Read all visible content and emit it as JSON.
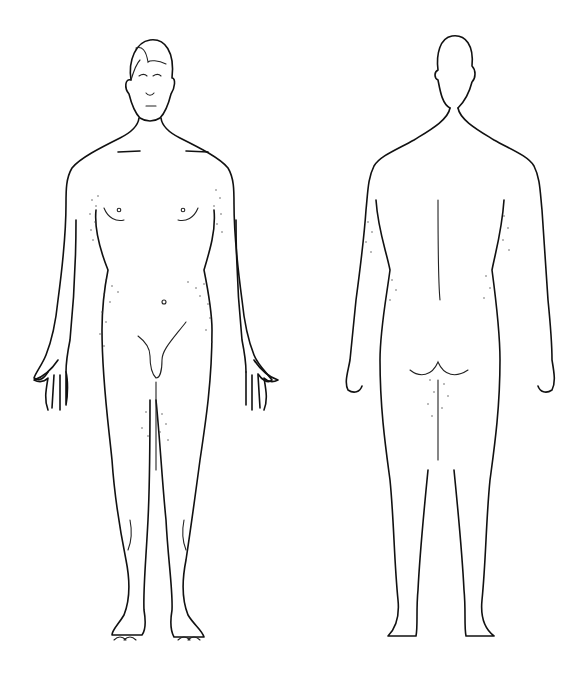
{
  "diagram": {
    "type": "body-outline",
    "views": [
      {
        "name": "anterior",
        "label": ""
      },
      {
        "name": "posterior",
        "label": ""
      }
    ],
    "line_color": "#111111",
    "background": "#ffffff",
    "shading": "stippled hair regions"
  }
}
